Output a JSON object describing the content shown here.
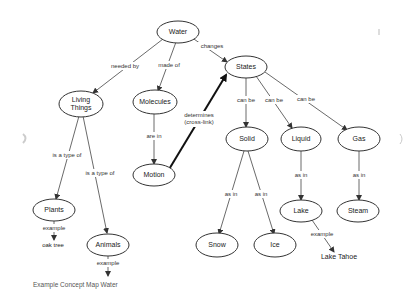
{
  "diagram": {
    "caption": "Example Concept Map Water",
    "colors": {
      "stroke": "#333333",
      "text": "#222222",
      "background": "#ffffff"
    },
    "nodes": {
      "water": "Water",
      "states": "States",
      "living_things_1": "Living",
      "living_things_2": "Things",
      "molecules": "Molecules",
      "solid": "Solid",
      "liquid": "Liquid",
      "gas": "Gas",
      "motion": "Motion",
      "lake": "Lake",
      "steam": "Steam",
      "plants": "Plants",
      "animals": "Animals",
      "snow": "Snow",
      "ice": "Ice",
      "oak_tree": "oak tree",
      "lake_tahoe": "Lake Tahoe"
    },
    "links": {
      "water_living": "needed by",
      "water_molecules": "made of",
      "water_states": "changes",
      "molecules_motion": "are in",
      "motion_states_1": "determines",
      "motion_states_2": "(cross-link)",
      "states_solid": "can be",
      "states_liquid": "can be",
      "states_gas": "can be",
      "living_plants": "is a type of",
      "living_animals": "is a type of",
      "solid_snow": "as in",
      "solid_ice": "as in",
      "liquid_lake": "as in",
      "gas_steam": "as in",
      "plants_oak": "example",
      "animals_example": "example",
      "lake_tahoe": "example"
    }
  }
}
